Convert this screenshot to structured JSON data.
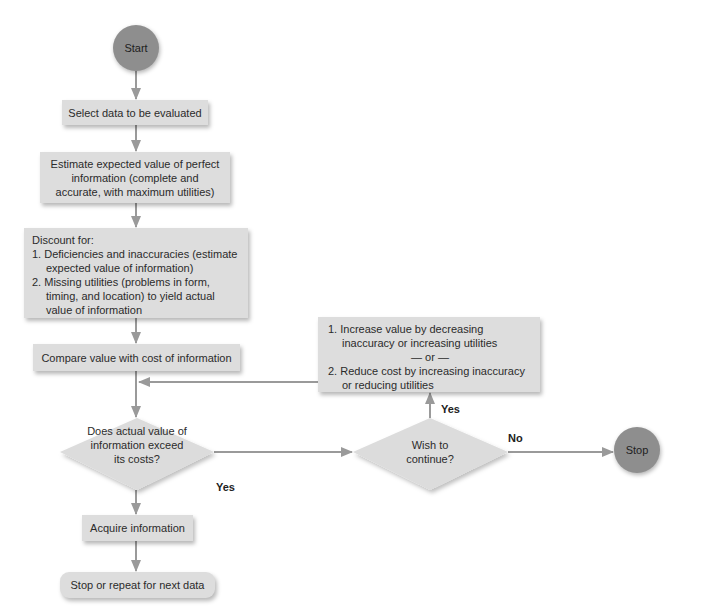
{
  "diagram": {
    "type": "flowchart",
    "colors": {
      "terminal_fill": "#8e8e8e",
      "process_fill": "#dddddd",
      "decision_fill": "#dcdcdc",
      "arrow": "#9a9a9a"
    },
    "nodes": {
      "start": {
        "label": "Start"
      },
      "select": {
        "label": "Select data to be evaluated"
      },
      "estimate": {
        "label": "Estimate expected value of perfect information (complete and accurate, with maximum utilities)"
      },
      "discount": {
        "title": "Discount for:",
        "items": [
          "1. Deficiencies and inaccuracies (estimate expected value of information)",
          "2. Missing utilities (problems in form, timing, and location) to yield actual value of information"
        ]
      },
      "compare": {
        "label": "Compare value with cost of information"
      },
      "decision_exceed": {
        "label": "Does actual value of information exceed its costs?"
      },
      "decision_continue": {
        "label": "Wish to continue?"
      },
      "improve": {
        "items": [
          "1. Increase value by decreasing inaccuracy or increasing utilities",
          "2. Reduce cost by increasing inaccuracy or reducing utilities"
        ],
        "separator": "— or —"
      },
      "stop": {
        "label": "Stop"
      },
      "acquire": {
        "label": "Acquire information"
      },
      "repeat": {
        "label": "Stop or repeat for next data"
      }
    },
    "edge_labels": {
      "exceed_no": "No",
      "exceed_yes": "Yes",
      "continue_yes": "Yes",
      "continue_no": "No"
    }
  }
}
